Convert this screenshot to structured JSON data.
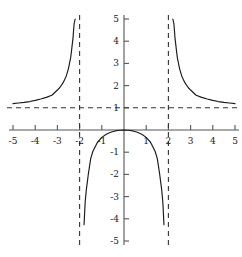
{
  "chart_data": {
    "type": "line",
    "title": "",
    "subtitle": "",
    "xlabel": "",
    "ylabel": "",
    "xlim": [
      -5,
      5
    ],
    "ylim": [
      -5,
      5
    ],
    "grid": false,
    "legend": false,
    "function": "y = x^2/(x^2 - 4)",
    "xticks": [
      -5,
      -4,
      -3,
      -2,
      -1,
      1,
      2,
      3,
      4,
      5
    ],
    "yticks": [
      -5,
      -4,
      -3,
      -2,
      -1,
      1,
      2,
      3,
      4,
      5
    ],
    "xtick_labels": [
      "-5",
      "-4",
      "-3",
      "-2",
      "-1",
      "1",
      "2",
      "3",
      "4",
      "5"
    ],
    "ytick_labels": [
      "-5",
      "-4",
      "-3",
      "-2",
      "-1",
      "1",
      "2",
      "3",
      "4",
      "5"
    ],
    "asymptotes": {
      "vertical": [
        -2,
        2
      ],
      "horizontal": [
        1
      ],
      "style": "dashed"
    },
    "series": [
      {
        "name": "left-branch",
        "points": [
          [
            -5.0,
            1.19
          ],
          [
            -4.75,
            1.217
          ],
          [
            -4.5,
            1.246
          ],
          [
            -4.25,
            1.281
          ],
          [
            -4.0,
            1.333
          ],
          [
            -3.75,
            1.396
          ],
          [
            -3.5,
            1.471
          ],
          [
            -3.25,
            1.566
          ],
          [
            -3.0,
            1.8
          ],
          [
            -2.9,
            1.903
          ],
          [
            -2.8,
            2.042
          ],
          [
            -2.7,
            2.213
          ],
          [
            -2.6,
            2.435
          ],
          [
            -2.5,
            2.778
          ],
          [
            -2.4,
            3.273
          ],
          [
            -2.3,
            4.114
          ],
          [
            -2.25,
            4.765
          ],
          [
            -2.2,
            5.0
          ]
        ]
      },
      {
        "name": "middle-branch",
        "points": [
          [
            -1.8,
            -4.263
          ],
          [
            -1.75,
            -3.267
          ],
          [
            -1.7,
            -2.718
          ],
          [
            -1.6,
            -1.939
          ],
          [
            -1.5,
            -1.286
          ],
          [
            -1.4,
            -0.959
          ],
          [
            -1.2,
            -0.563
          ],
          [
            -1.0,
            -0.333
          ],
          [
            -0.8,
            -0.19
          ],
          [
            -0.6,
            -0.099
          ],
          [
            -0.4,
            -0.042
          ],
          [
            -0.2,
            -0.01
          ],
          [
            0.0,
            0.0
          ],
          [
            0.2,
            -0.01
          ],
          [
            0.4,
            -0.042
          ],
          [
            0.6,
            -0.099
          ],
          [
            0.8,
            -0.19
          ],
          [
            1.0,
            -0.333
          ],
          [
            1.2,
            -0.563
          ],
          [
            1.4,
            -0.959
          ],
          [
            1.5,
            -1.286
          ],
          [
            1.6,
            -1.939
          ],
          [
            1.7,
            -2.718
          ],
          [
            1.75,
            -3.267
          ],
          [
            1.8,
            -4.263
          ]
        ]
      },
      {
        "name": "right-branch",
        "points": [
          [
            2.2,
            5.0
          ],
          [
            2.25,
            4.765
          ],
          [
            2.3,
            4.114
          ],
          [
            2.4,
            3.273
          ],
          [
            2.5,
            2.778
          ],
          [
            2.6,
            2.435
          ],
          [
            2.7,
            2.213
          ],
          [
            2.8,
            2.042
          ],
          [
            2.9,
            1.903
          ],
          [
            3.0,
            1.8
          ],
          [
            3.25,
            1.566
          ],
          [
            3.5,
            1.471
          ],
          [
            3.75,
            1.396
          ],
          [
            4.0,
            1.333
          ],
          [
            4.25,
            1.281
          ],
          [
            4.5,
            1.246
          ],
          [
            4.75,
            1.217
          ],
          [
            5.0,
            1.19
          ]
        ]
      }
    ],
    "colors": {
      "curve": "#1a1a1a",
      "axis": "#555555",
      "asymptote": "#333333",
      "background": "#ffffff",
      "text": "#1a1a1a"
    }
  }
}
